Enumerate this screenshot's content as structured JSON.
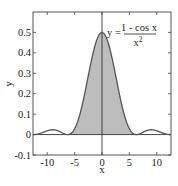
{
  "chart_data": {
    "type": "line",
    "title": "",
    "xlabel": "x",
    "ylabel": "y",
    "xlim": [
      -12.6,
      12.6
    ],
    "ylim": [
      -0.1,
      0.6
    ],
    "grid": false,
    "legend": null,
    "function": "y = (1 - cos x) / x^2",
    "annotation": {
      "lhs": "y =",
      "numerator": "1 - cos x",
      "denominator": "x",
      "denominator_exponent": "2"
    },
    "shaded_region": {
      "x_from": -6.2832,
      "x_to": 6.2832,
      "color": "#bdbdbd"
    },
    "line_color": "#555555",
    "xticks": [
      -10,
      -5,
      0,
      5,
      10
    ],
    "xtick_labels": [
      "-10",
      "-5",
      "0",
      "5",
      "10"
    ],
    "yticks": [
      -0.1,
      0,
      0.1,
      0.2,
      0.3,
      0.4,
      0.5
    ],
    "ytick_labels": [
      "-0.1",
      "0",
      "0.1",
      "0.2",
      "0.3",
      "0.4",
      "0.5"
    ],
    "series": [
      {
        "name": "(1 - cos x)/x^2",
        "x": [
          -12,
          -11,
          -10,
          -9,
          -8,
          -7,
          -6,
          -5,
          -4,
          -3,
          -2,
          -1,
          0,
          1,
          2,
          3,
          4,
          5,
          6,
          7,
          8,
          9,
          10,
          11,
          12
        ],
        "y": [
          0.0011,
          0.0082,
          0.0184,
          0.0236,
          0.0179,
          0.005,
          0.0011,
          0.0287,
          0.1034,
          0.2211,
          0.354,
          0.4597,
          0.5,
          0.4597,
          0.354,
          0.2211,
          0.1034,
          0.0287,
          0.0011,
          0.005,
          0.0179,
          0.0236,
          0.0184,
          0.0082,
          0.0011
        ]
      }
    ]
  }
}
